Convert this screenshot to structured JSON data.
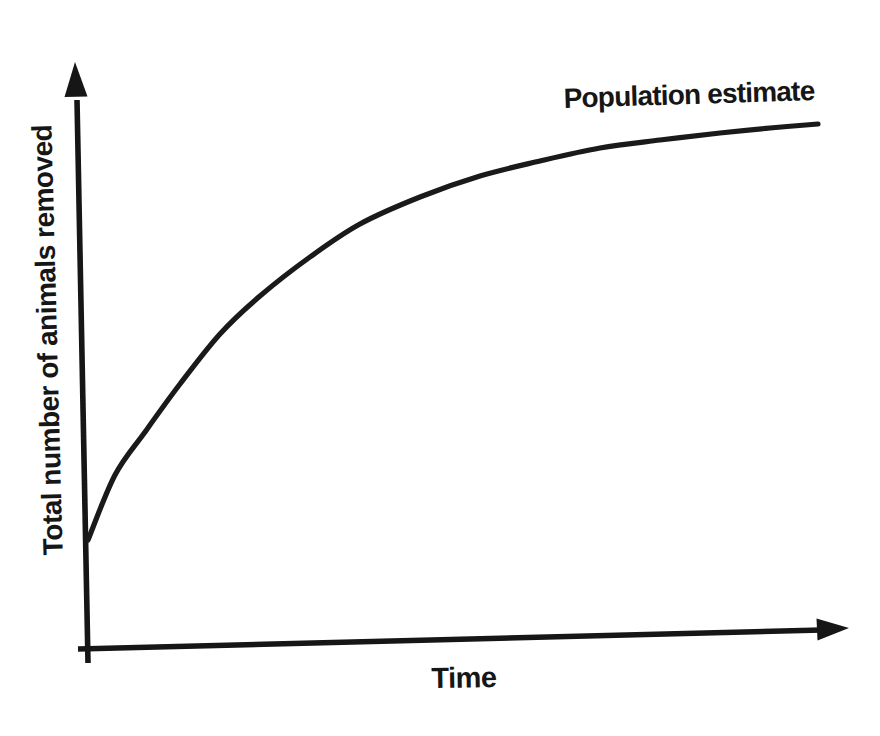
{
  "figure": {
    "background_color": "#ffffff",
    "ink_color": "#161616"
  },
  "labels": {
    "y_axis_label": "Total number of animals removed",
    "x_axis_label": "Time",
    "curve_label": "Population estimate"
  },
  "chart_data": {
    "type": "line",
    "title": "",
    "xlabel": "Time",
    "ylabel": "Total number of animals removed",
    "grid": false,
    "legend_position": "none",
    "axis_numeric_scale": "none (qualitative sketch with arrow-tipped axes, no tick marks or tick labels)",
    "annotations": [
      "Population estimate"
    ],
    "axes_px": {
      "origin": [
        87,
        648
      ],
      "x_axis_from": [
        78,
        649
      ],
      "x_axis_to": [
        822,
        630
      ],
      "x_arrow_tip": [
        849,
        628
      ],
      "y_axis_from": [
        88,
        663
      ],
      "y_axis_to": [
        77,
        100
      ],
      "y_arrow_tip": [
        75,
        62
      ]
    },
    "series": [
      {
        "name": "Population estimate",
        "shape": "saturating-growth",
        "points_px": [
          [
            88,
            540
          ],
          [
            115,
            475
          ],
          [
            145,
            432
          ],
          [
            180,
            384
          ],
          [
            220,
            334
          ],
          [
            260,
            296
          ],
          [
            310,
            257
          ],
          [
            360,
            224
          ],
          [
            420,
            197
          ],
          [
            480,
            176
          ],
          [
            540,
            161
          ],
          [
            600,
            148
          ],
          [
            660,
            140
          ],
          [
            720,
            133
          ],
          [
            770,
            128
          ],
          [
            818,
            124
          ]
        ]
      }
    ]
  }
}
